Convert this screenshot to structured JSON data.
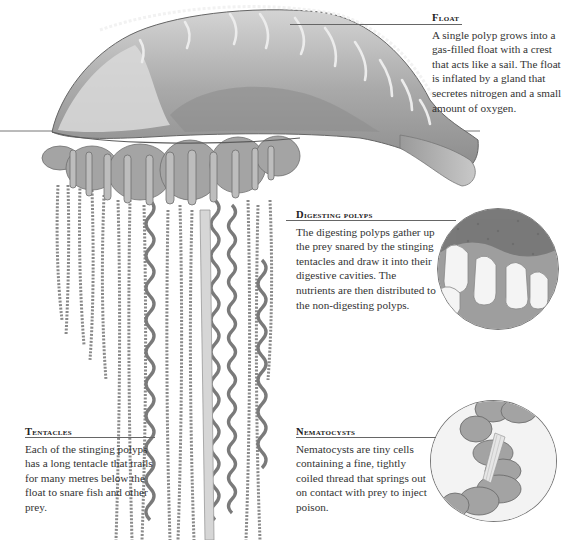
{
  "figure": {
    "palette": {
      "float_fill": "#b9b9b9",
      "float_dark": "#7d7d7d",
      "tentacle": "#8a8a8a",
      "rule": "#666666",
      "text": "#333333"
    }
  },
  "annotations": {
    "float": {
      "title": "Float",
      "body": "A single polyp grows into a gas-filled float with a crest that acts like a sail. The float is inflated by a gland that secretes nitrogen and a small amount of oxygen."
    },
    "digesting_polyps": {
      "title": "Digesting polyps",
      "body": "The digesting polyps gather up the prey snared by the stinging tentacles and draw it into their digestive cavities. The nutrients are then distributed to the non-digesting polyps."
    },
    "tentacles": {
      "title": "Tentacles",
      "body": "Each of the stinging polyps has a long tentacle that trails for many metres below the float to snare fish and other prey."
    },
    "nematocysts": {
      "title": "Nematocysts",
      "body": "Nematocysts are tiny cells containing a fine, tightly coiled thread that springs out on contact with prey to inject poison."
    }
  }
}
